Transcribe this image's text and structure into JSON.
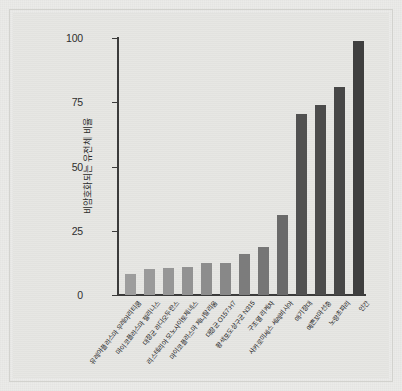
{
  "chart_data": {
    "type": "bar",
    "title": "",
    "subtitle": "",
    "xlabel": "",
    "ylabel": "비암호화되는 유전체 비율",
    "ylim": [
      0,
      100
    ],
    "yticks": [
      "0",
      "25",
      "50",
      "75",
      "100"
    ],
    "ytick_values": [
      0,
      25,
      50,
      75,
      100
    ],
    "grid": false,
    "legend": null,
    "categories": [
      "유레아플라스마 우레아리티쿰",
      "마이코플라스마 젤리나스",
      "대장균 라디오두란스",
      "리스테리아 모노사이토제네스",
      "마이코플라스마 제니탈리움",
      "대장균 O157:H7",
      "황색포도상구균 N315",
      "구조열 리케차",
      "사카로미세스 세레비시아",
      "애기장대",
      "예쁜꼬마선충",
      "노랑초파리",
      "인간"
    ],
    "values": [
      8,
      10,
      10.5,
      11,
      12.5,
      12.5,
      16,
      18.5,
      31,
      70.5,
      74,
      81,
      99
    ],
    "bar_colors": [
      "#9d9d9d",
      "#9a9a9a",
      "#969696",
      "#929292",
      "#8d8d8d",
      "#888888",
      "#7c7c7c",
      "#767676",
      "#6a6a6a",
      "#515151",
      "#4c4c4c",
      "#474747",
      "#3f3f3f"
    ]
  },
  "axis": {
    "line_color": "#3b3b3b"
  },
  "figure": {
    "background": "#e6e6e3",
    "page_background": "#ebebe9",
    "frame_color": "#d2d2ce"
  }
}
